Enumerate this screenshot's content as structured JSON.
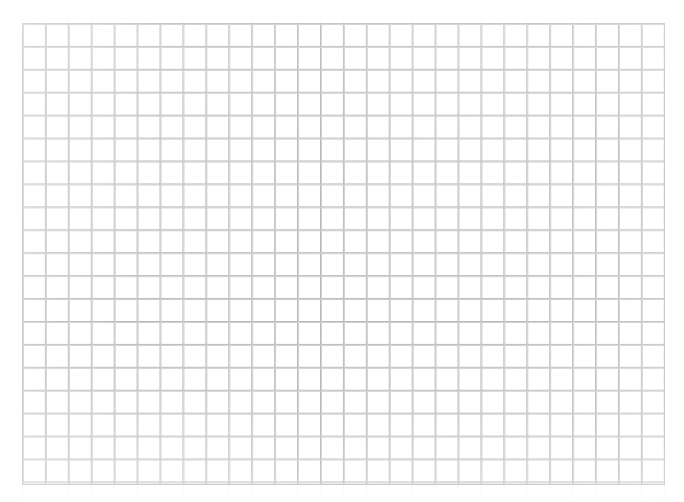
{
  "document": {
    "kind": "grid-paper-scan",
    "title": "Blank quadrille grid sheet",
    "background_color": "#ffffff",
    "canvas": {
      "width_px": 684,
      "height_px": 502
    }
  },
  "grid": {
    "name": "quadrille-grid",
    "origin_x_px": 22,
    "origin_y_px": 23,
    "width_px": 643,
    "height_px": 462,
    "cell_size_px": 22.93,
    "columns": 28,
    "rows": 20,
    "line_color": "#b9b9bd",
    "echo_line_color": "#cdcdd2",
    "border_color": "#bdbdc1",
    "line_weight_px": 1,
    "has_major_lines": false,
    "labels": [],
    "annotations": []
  },
  "margins": {
    "left_px": 22,
    "top_px": 23,
    "right_px": 19,
    "bottom_px": 17,
    "color": "#ffffff"
  },
  "chart_data": {
    "type": "table",
    "title": "",
    "xlabel": "",
    "ylabel": "",
    "categories": [],
    "values": [],
    "series": [],
    "grid": true,
    "legend": "none",
    "note": "Empty grid/graph paper — no plotted data, no tick labels, no legend."
  }
}
